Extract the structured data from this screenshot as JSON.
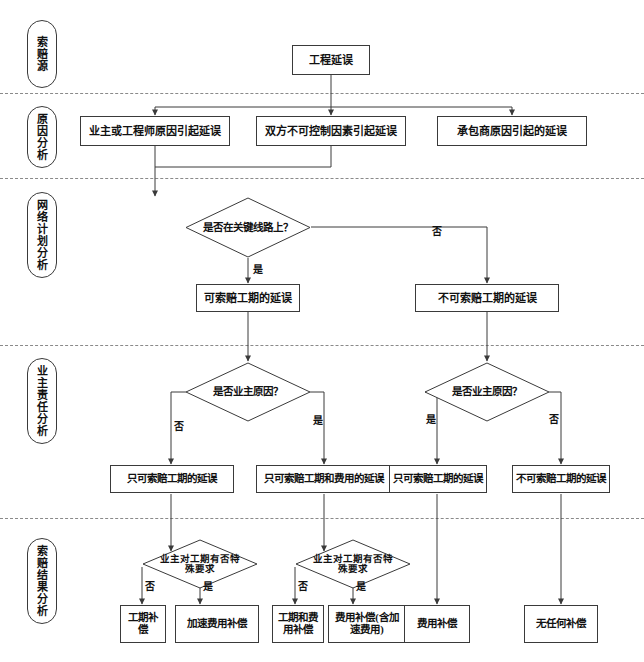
{
  "diagram": {
    "title_text": "工程延误索赔分析流程图",
    "stages": [
      {
        "id": "stage-claim-source",
        "label": "索赔源"
      },
      {
        "id": "stage-cause-analysis",
        "label": "原因分析"
      },
      {
        "id": "stage-network-plan-analysis",
        "label": "网络计划分析"
      },
      {
        "id": "stage-owner-liability-analysis",
        "label": "业主责任分析"
      },
      {
        "id": "stage-claim-result-analysis",
        "label": "索赔结果分析"
      }
    ],
    "nodes": {
      "root": "工程延误",
      "cause_owner_engineer": "业主或工程师原因引起延误",
      "cause_force_majeure": "双方不可控制因素引起延误",
      "cause_contractor": "承包商原因引起的延误",
      "decision_critical_path": "是否在关键线路上？",
      "claimable_duration": "可索赔工期的延误",
      "non_claimable_duration": "不可索赔工期的延误",
      "decision_owner_cause_left": "是否业主原因？",
      "decision_owner_cause_right": "是否业主原因？",
      "result_duration_only_left": "只可索赔工期的延误",
      "result_duration_and_cost": "只可索赔工期和费用的延误",
      "result_duration_only_right": "只可索赔工期的延误",
      "result_non_claimable": "不可索赔工期的延误",
      "decision_special_req_left": "业主对工期有否特殊要求",
      "decision_special_req_right": "业主对工期有否特殊要求",
      "out_duration_comp": "工期补偿",
      "out_accel_cost_comp": "加速费用补偿",
      "out_duration_and_cost_comp": "工期和费用补偿",
      "out_cost_comp_with_accel": "费用补偿(含加速费用)",
      "out_cost_comp": "费用补偿",
      "out_no_comp": "无任何补偿"
    },
    "edge_labels": {
      "critical_yes": "是",
      "critical_no": "否",
      "owner_left_no": "否",
      "owner_left_yes": "是",
      "owner_right_yes": "是",
      "owner_right_no": "否",
      "special_left_no": "否",
      "special_left_yes": "是",
      "special_right_no": "否",
      "special_right_yes": "是"
    },
    "colors": {
      "stroke": "#3a3a3a",
      "text": "#111111",
      "separator": "#8a8a8a",
      "background": "#ffffff"
    }
  }
}
